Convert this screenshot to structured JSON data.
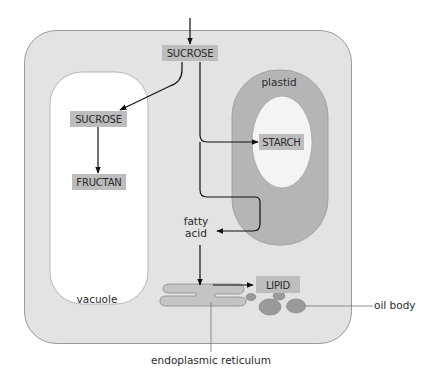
{
  "diagram": {
    "type": "cell-carbon-metabolism",
    "colors": {
      "cell": "#e3e3e3",
      "cell_border": "#9a9a9a",
      "vacuole": "#ffffff",
      "plastid": "#b5b5b5",
      "starch_grain": "#f4f4f4",
      "box": "#bdbdbd",
      "er": "#c4c4c4",
      "oil_body": "#9a9a9a",
      "arrow": "#111111",
      "text": "#2a2a2a"
    },
    "boxes": {
      "sucrose_cytosol": "SUCROSE",
      "sucrose_vacuole": "SUCROSE",
      "fructan": "FRUCTAN",
      "starch": "STARCH",
      "lipid": "LIPID"
    },
    "labels": {
      "plastid": "plastid",
      "vacuole": "vacuole",
      "fatty_acid_line1": "fatty",
      "fatty_acid_line2": "acid",
      "oil_body": "oil body",
      "er": "endoplasmic reticulum"
    },
    "flows": [
      {
        "from": "external",
        "to": "SUCROSE (cytosol)"
      },
      {
        "from": "SUCROSE (cytosol)",
        "to": "SUCROSE (vacuole)"
      },
      {
        "from": "SUCROSE (vacuole)",
        "to": "FRUCTAN"
      },
      {
        "from": "SUCROSE (cytosol)",
        "to": "STARCH"
      },
      {
        "from": "SUCROSE (cytosol)",
        "to": "plastid",
        "then": "fatty acid"
      },
      {
        "from": "fatty acid",
        "to": "endoplasmic reticulum"
      },
      {
        "from": "endoplasmic reticulum",
        "to": "LIPID"
      }
    ]
  }
}
